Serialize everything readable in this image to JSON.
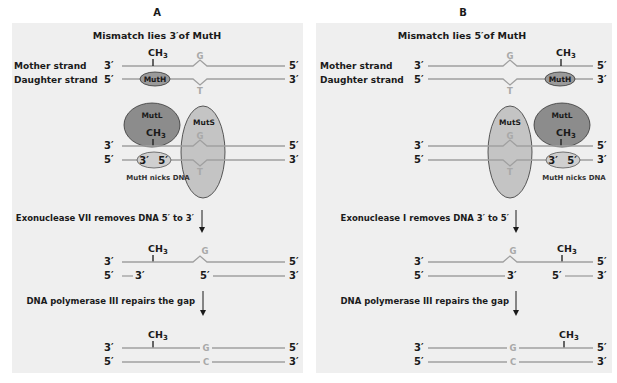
{
  "colors": {
    "panel_bg": "#efefef",
    "strand": "#a0a0a0",
    "base_text": "#a8a8a8",
    "mutl_fill": "#8c8c8c",
    "muts_fill": "#c4c4c4",
    "muth_fill": "#9a9a9a",
    "muth_nick_fill": "#cfcfcf",
    "text": "#1a1a1a"
  },
  "panels": [
    {
      "letter": "A",
      "title": "Mismatch lies 3′of MutH",
      "mother_label": "Mother strand",
      "daughter_label": "Daughter strand",
      "mother_ends": [
        "3′",
        "5′"
      ],
      "daughter_ends": [
        "5′",
        "3′"
      ],
      "methyl": "CH3",
      "mismatch_top": "G",
      "mismatch_bottom": "T",
      "muth": "MutH",
      "mutl": "MutL",
      "muts": "MutS",
      "nick_ends": [
        "3′",
        "5′"
      ],
      "nick_caption": "MutH nicks DNA",
      "step1": "Exonuclease VII removes DNA 5′ to 3′",
      "gap_ends": [
        "3′",
        "5′"
      ],
      "step2": "DNA polymerase III repairs the gap",
      "repaired_top": "G",
      "repaired_bottom": "C"
    },
    {
      "letter": "B",
      "title": "Mismatch lies 5′of MutH",
      "mother_label": "Mother strand",
      "daughter_label": "Daughter strand",
      "mother_ends": [
        "3′",
        "5′"
      ],
      "daughter_ends": [
        "5′",
        "3′"
      ],
      "methyl": "CH3",
      "mismatch_top": "G",
      "mismatch_bottom": "T",
      "muth": "MutH",
      "mutl": "MutL",
      "muts": "MutS",
      "nick_ends": [
        "3′",
        "5′"
      ],
      "nick_caption": "MutH nicks DNA",
      "step1": "Exonuclease I removes DNA 3′ to 5′",
      "gap_ends": [
        "3′",
        "5′"
      ],
      "step2": "DNA polymerase III repairs the gap",
      "repaired_top": "G",
      "repaired_bottom": "C"
    }
  ]
}
